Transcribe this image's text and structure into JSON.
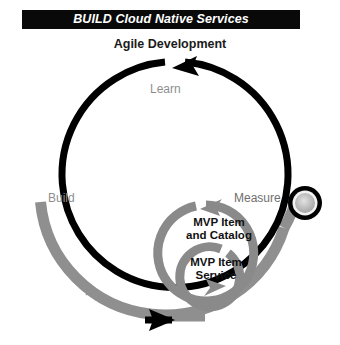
{
  "header": {
    "banner_title": "BUILD Cloud Native Services",
    "subtitle": "Agile Development"
  },
  "diagram": {
    "type": "cycle-diagram",
    "outer_loop": {
      "name": "agile-development-loop",
      "color": "#000000",
      "direction": "clockwise",
      "stages": [
        {
          "id": "learn",
          "label": "Learn",
          "color": "#8e8e8e",
          "position": "top"
        },
        {
          "id": "build",
          "label": "Build",
          "color": "#8e8e8e",
          "position": "left"
        },
        {
          "id": "measure",
          "label": "Measure",
          "color": "#6f6f6f",
          "position": "right"
        }
      ]
    },
    "devops_loop": {
      "name": "devops-loop",
      "label": "DevOps",
      "color": "#909090",
      "direction": "clockwise"
    },
    "inner_loops": [
      {
        "id": "mvp-item-and-catalog",
        "label_line1": "MVP  Item",
        "label_line2": "and  Catalog",
        "color": "#8a8a8a",
        "text_color": "#111111"
      },
      {
        "id": "mvp-item-service",
        "label_line1": "MVP  Item",
        "label_line2": "Service",
        "color": "#8a8a8a",
        "text_color": "#111111"
      }
    ],
    "node": {
      "id": "measure-node",
      "ring_color": "#000000",
      "fill_color": "#b8b8b8"
    }
  },
  "colors": {
    "banner_bg": "#090909",
    "banner_text": "#ffffff",
    "black": "#000000",
    "gray": "#8e8e8e",
    "dark_gray": "#6f6f6f"
  }
}
